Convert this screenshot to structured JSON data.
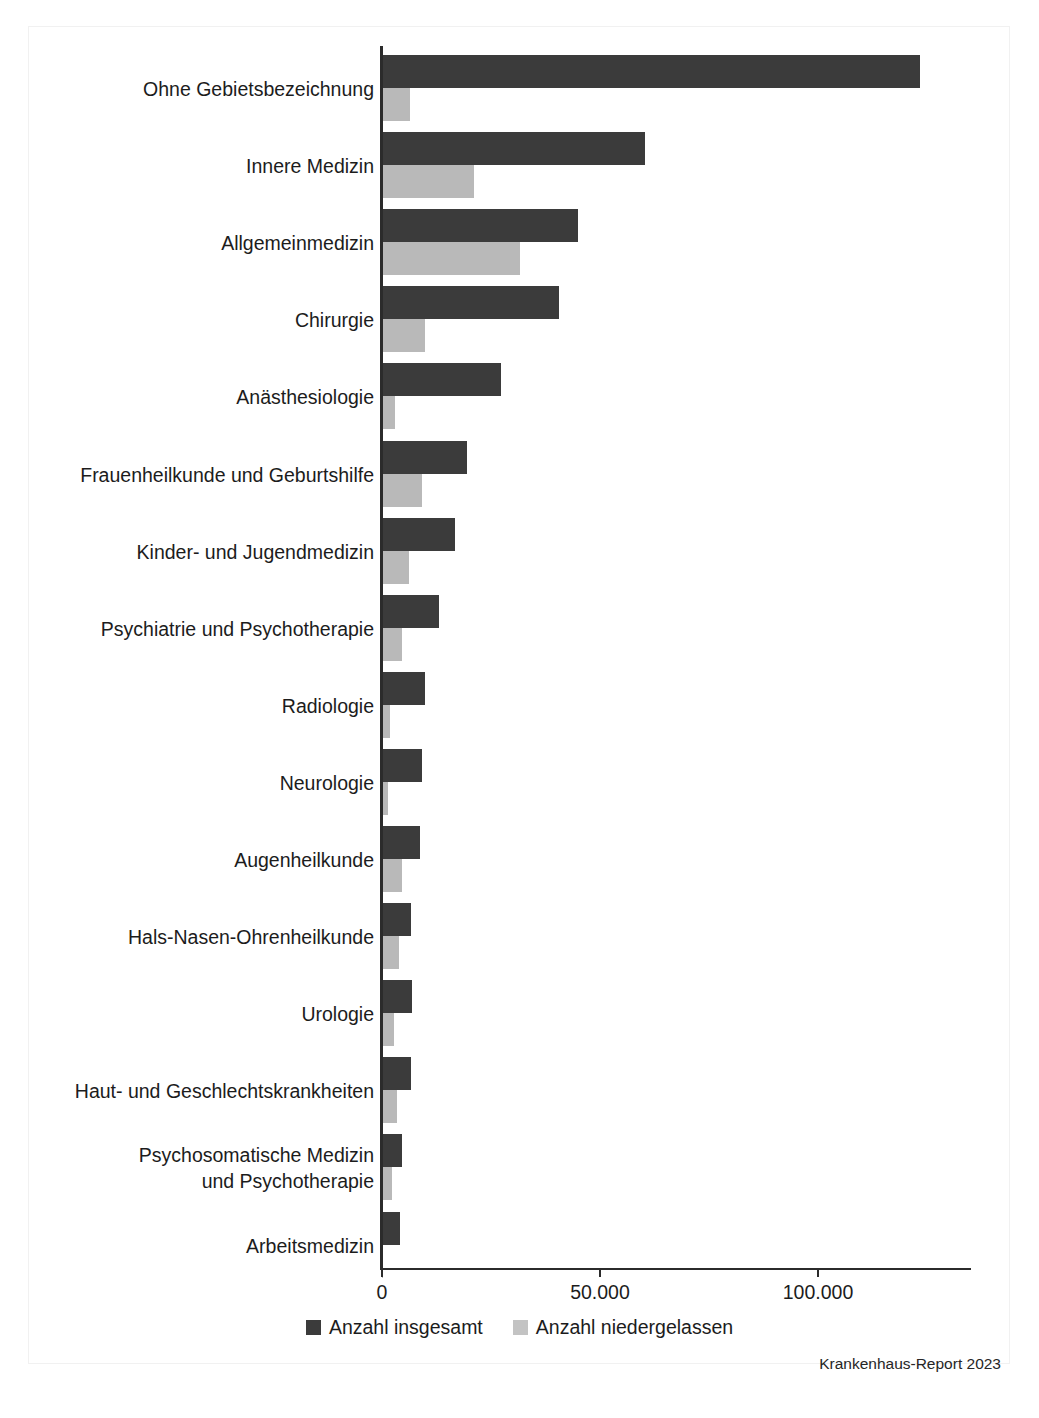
{
  "figure": {
    "source_note": "Krankenhaus-Report 2023",
    "colors": {
      "total": "#3b3b3b",
      "resident": "#b9b9b9",
      "axis": "#2b2b2b",
      "text": "#1c1c1c",
      "frame": "#f1f1f1",
      "background": "#ffffff"
    }
  },
  "legend": {
    "items": [
      {
        "label": "Anzahl insgesamt",
        "swatch": "total"
      },
      {
        "label": "Anzahl niedergelassen",
        "swatch": "resident"
      }
    ]
  },
  "chart_data": {
    "type": "bar",
    "orientation": "horizontal",
    "title": "",
    "subtitle": "",
    "xlabel": "",
    "ylabel": "",
    "xlim": [
      0,
      135500
    ],
    "grid": false,
    "legend_position": "bottom-center",
    "xticks": [
      0,
      50000,
      100000
    ],
    "xticklabels": [
      "0",
      "50.000",
      "100.000"
    ],
    "categories": [
      "Ohne Gebietsbezeichnung",
      "Innere Medizin",
      "Allgemeinmedizin",
      "Chirurgie",
      "Anästhesiologie",
      "Frauenheilkunde und Geburtshilfe",
      "Kinder- und Jugendmedizin",
      "Psychiatrie und Psychotherapie",
      "Radiologie",
      "Neurologie",
      "Augenheilkunde",
      "Hals-Nasen-Ohrenheilkunde",
      "Urologie",
      "Haut- und Geschlechtskrankheiten",
      "Psychosomatische Medizin\nund Psychotherapie",
      "Arbeitsmedizin"
    ],
    "series": [
      {
        "name": "Anzahl insgesamt",
        "color": "#3b3b3b",
        "values": [
          123400,
          60300,
          45000,
          40600,
          27300,
          19500,
          16700,
          13100,
          9900,
          9200,
          8700,
          6600,
          6900,
          6600,
          4600,
          4100
        ]
      },
      {
        "name": "Anzahl niedergelassen",
        "color": "#b9b9b9",
        "values": [
          6400,
          21100,
          31600,
          9900,
          3000,
          9200,
          6200,
          4600,
          1800,
          1400,
          4600,
          3900,
          2800,
          3400,
          2300,
          200
        ]
      }
    ]
  }
}
